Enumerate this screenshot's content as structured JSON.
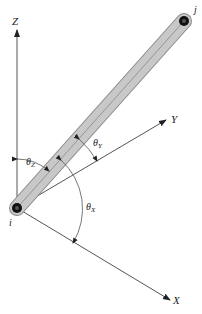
{
  "diagram": {
    "title": "",
    "axes": {
      "z_label": "Z",
      "y_label": "Y",
      "x_label": "X"
    },
    "nodes": {
      "start_label": "i",
      "end_label": "j"
    },
    "angles": {
      "theta_z": "θ",
      "theta_z_sub": "Z",
      "theta_y": "θ",
      "theta_y_sub": "Y",
      "theta_x": "θ",
      "theta_x_sub": "X"
    },
    "colors": {
      "member_fill": "#c8c8c8",
      "member_stroke": "#8a8a8a",
      "line": "#444444",
      "node": "#111111"
    }
  }
}
